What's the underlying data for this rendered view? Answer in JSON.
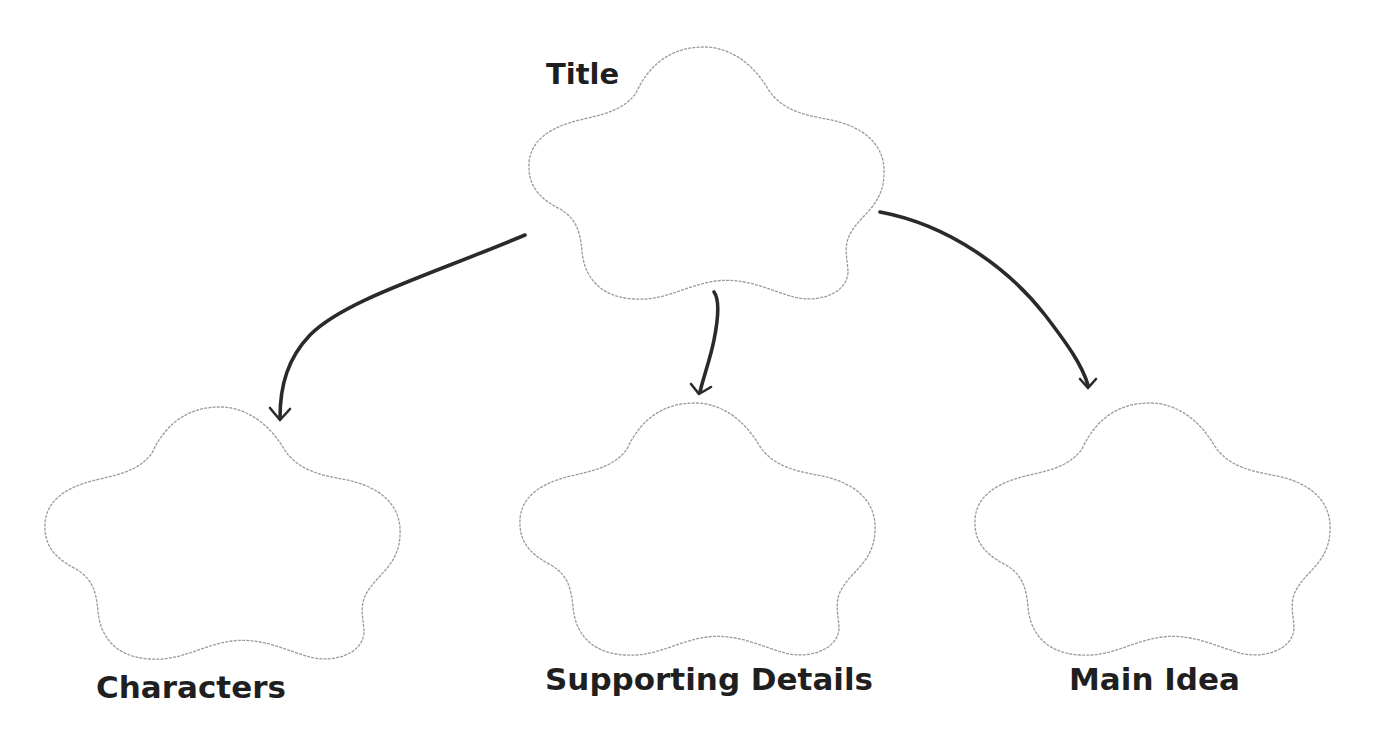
{
  "diagram": {
    "type": "graphic-organizer",
    "colors": {
      "background": "#ffffff",
      "cloud_outline": "#9a9a9a",
      "arrow": "#2a2a2a",
      "label_text": "#1f1f1f"
    },
    "nodes": [
      {
        "id": "title",
        "label": "Title",
        "shape": "cloud",
        "content": ""
      },
      {
        "id": "characters",
        "label": "Characters",
        "shape": "cloud",
        "content": ""
      },
      {
        "id": "supporting-details",
        "label": "Supporting Details",
        "shape": "cloud",
        "content": ""
      },
      {
        "id": "main-idea",
        "label": "Main Idea",
        "shape": "cloud",
        "content": ""
      }
    ],
    "edges": [
      {
        "from": "title",
        "to": "characters",
        "style": "hand-drawn curved arrow"
      },
      {
        "from": "title",
        "to": "supporting-details",
        "style": "hand-drawn short arrow"
      },
      {
        "from": "title",
        "to": "main-idea",
        "style": "hand-drawn curved arrow"
      }
    ]
  },
  "labels": {
    "title": "Title",
    "characters": "Characters",
    "supporting_details": "Supporting Details",
    "main_idea": "Main Idea"
  }
}
